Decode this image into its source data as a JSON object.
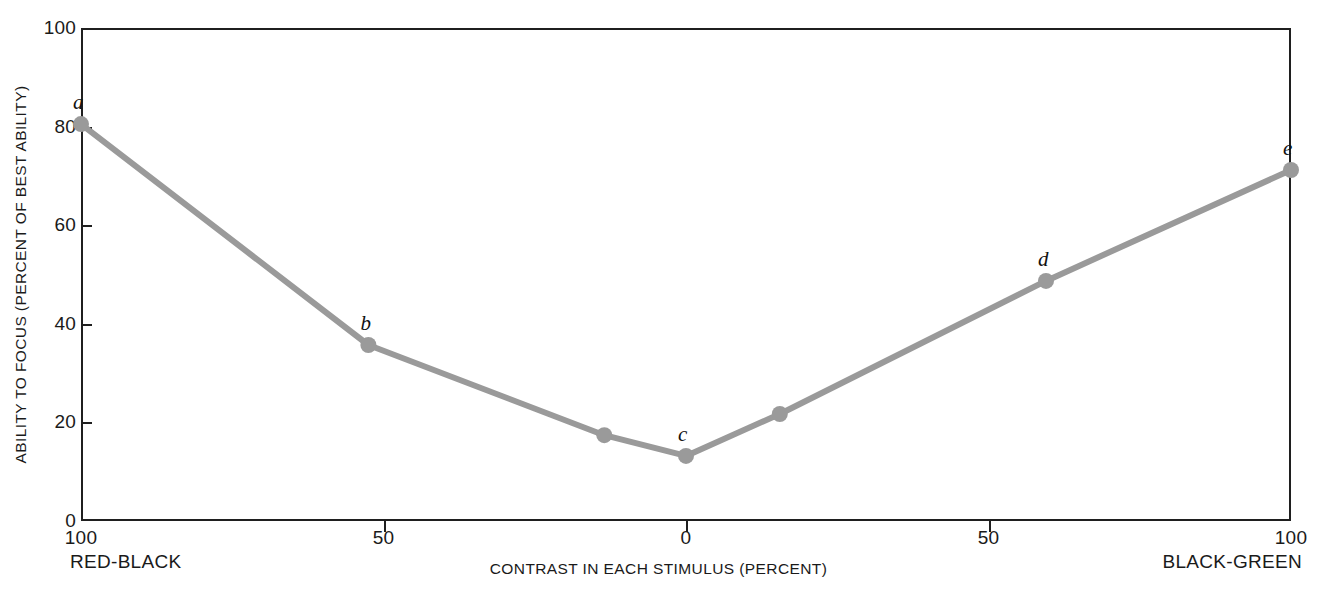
{
  "chart_data": {
    "type": "line",
    "title": "",
    "xlabel": "CONTRAST IN EACH STIMULUS (PERCENT)",
    "ylabel": "ABILITY TO FOCUS (PERCENT OF BEST ABILITY)",
    "x_axis": {
      "left_end_label": "RED-BLACK",
      "right_end_label": "BLACK-GREEN",
      "tick_labels": [
        "100",
        "50",
        "0",
        "50",
        "100"
      ],
      "tick_positions": [
        -100,
        -50,
        0,
        50,
        100
      ],
      "axis_note": "left half is RED-BLACK contrast decreasing 100 to 0; right half is BLACK-GREEN contrast increasing 0 to 100"
    },
    "y_axis": {
      "tick_labels": [
        "0",
        "20",
        "40",
        "60",
        "80",
        "100"
      ],
      "ylim": [
        0,
        100
      ]
    },
    "grid": false,
    "legend": "none",
    "series": [
      {
        "name": "Ability to focus",
        "color": "#9a9a9a",
        "points": [
          {
            "label": "a",
            "x": -100,
            "y": 80.5
          },
          {
            "label": "b",
            "x": -52.5,
            "y": 35.7
          },
          {
            "label": "",
            "x": -13.5,
            "y": 17.4
          },
          {
            "label": "c",
            "x": 0,
            "y": 13.2
          },
          {
            "label": "",
            "x": 15.5,
            "y": 21.7
          },
          {
            "label": "d",
            "x": 59.5,
            "y": 48.7
          },
          {
            "label": "e",
            "x": 100,
            "y": 71.2
          }
        ]
      }
    ],
    "colors": {
      "line": "#9a9a9a",
      "marker": "#9a9a9a",
      "axis": "#1f1f1f",
      "text": "#1a1a1a",
      "background": "#ffffff"
    }
  }
}
